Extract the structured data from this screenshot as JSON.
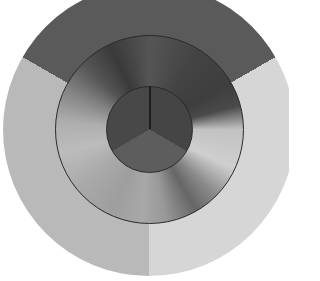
{
  "diagram": {
    "type": "concentric-grayscale-wheel",
    "center": [
      149,
      130
    ],
    "rings": [
      {
        "name": "outer",
        "radius": 146,
        "sectors": [
          {
            "from_deg": -60,
            "to_deg": 60,
            "color": "#5a5a5a"
          },
          {
            "from_deg": 60,
            "to_deg": 180,
            "color": "#d6d6d6"
          },
          {
            "from_deg": 180,
            "to_deg": 300,
            "color": "#b9b9b9"
          }
        ]
      },
      {
        "name": "middle",
        "radius": 95,
        "gradient_stops": [
          {
            "deg": 0,
            "color": "#555555"
          },
          {
            "deg": 30,
            "color": "#444444"
          },
          {
            "deg": 60,
            "color": "#3e3e3e"
          },
          {
            "deg": 75,
            "color": "#4a4a4a"
          },
          {
            "deg": 90,
            "color": "#c2c2c2"
          },
          {
            "deg": 115,
            "color": "#cfcfcf"
          },
          {
            "deg": 135,
            "color": "#8a8a8a"
          },
          {
            "deg": 150,
            "color": "#666666"
          },
          {
            "deg": 170,
            "color": "#999999"
          },
          {
            "deg": 185,
            "color": "#a8a8a8"
          },
          {
            "deg": 205,
            "color": "#9e9e9e"
          },
          {
            "deg": 230,
            "color": "#a9a9a9"
          },
          {
            "deg": 255,
            "color": "#bcbcbc"
          },
          {
            "deg": 275,
            "color": "#aeaeae"
          },
          {
            "deg": 295,
            "color": "#858585"
          },
          {
            "deg": 315,
            "color": "#555555"
          },
          {
            "deg": 335,
            "color": "#3a3a3a"
          },
          {
            "deg": 360,
            "color": "#555555"
          }
        ]
      },
      {
        "name": "inner",
        "radius": 43,
        "sectors": [
          {
            "from_deg": 0,
            "to_deg": 120,
            "color": "#454545"
          },
          {
            "from_deg": 120,
            "to_deg": 240,
            "color": "#5d5d5d"
          },
          {
            "from_deg": 240,
            "to_deg": 360,
            "color": "#484848"
          }
        ]
      }
    ],
    "line_color": "#2a2a2a"
  }
}
